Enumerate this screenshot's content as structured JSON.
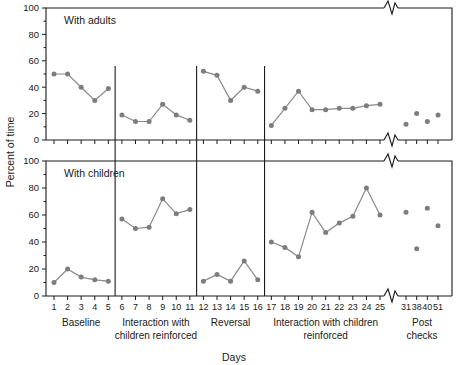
{
  "chart_data": {
    "type": "line",
    "title": "",
    "xlabel": "Days",
    "ylabel": "Percent of time",
    "ylim": [
      0,
      100
    ],
    "yticks": [
      0,
      20,
      40,
      60,
      80,
      100
    ],
    "grid": false,
    "legend": "none",
    "axis_break": true,
    "axis_break_note": "x-axis break between day 25 and day 31",
    "x": [
      1,
      2,
      3,
      4,
      5,
      6,
      7,
      8,
      9,
      10,
      11,
      12,
      13,
      14,
      15,
      16,
      17,
      18,
      19,
      20,
      21,
      22,
      23,
      24,
      25,
      31,
      38,
      40,
      51
    ],
    "xticklabels": [
      "1",
      "2",
      "3",
      "4",
      "5",
      "6",
      "7",
      "8",
      "9",
      "10",
      "11",
      "12",
      "13",
      "14",
      "15",
      "16",
      "17",
      "18",
      "19",
      "20",
      "21",
      "22",
      "23",
      "24",
      "25",
      "31",
      "38",
      "40",
      "51"
    ],
    "panels": [
      {
        "name": "with-adults",
        "title": "With adults",
        "series": [
          {
            "name": "Baseline",
            "days": [
              1,
              2,
              3,
              4,
              5
            ],
            "values": [
              50,
              50,
              40,
              30,
              39
            ],
            "connected": true
          },
          {
            "name": "Interaction with children reinforced",
            "days": [
              6,
              7,
              8,
              9,
              10,
              11
            ],
            "values": [
              19,
              14,
              14,
              27,
              19,
              15
            ],
            "connected": true
          },
          {
            "name": "Reversal",
            "days": [
              12,
              13,
              14,
              15,
              16
            ],
            "values": [
              52,
              49,
              30,
              40,
              37
            ],
            "connected": true
          },
          {
            "name": "Interaction with children reinforced (2)",
            "days": [
              17,
              18,
              19,
              20,
              21,
              22,
              23,
              24,
              25
            ],
            "values": [
              11,
              24,
              37,
              23,
              23,
              24,
              24,
              26,
              27
            ],
            "connected": true
          },
          {
            "name": "Post checks",
            "days": [
              31,
              38,
              40,
              51
            ],
            "values": [
              12,
              20,
              14,
              19
            ],
            "connected": false
          }
        ]
      },
      {
        "name": "with-children",
        "title": "With children",
        "series": [
          {
            "name": "Baseline",
            "days": [
              1,
              2,
              3,
              4,
              5
            ],
            "values": [
              10,
              20,
              14,
              12,
              11
            ],
            "connected": true
          },
          {
            "name": "Interaction with children reinforced",
            "days": [
              6,
              7,
              8,
              9,
              10,
              11
            ],
            "values": [
              57,
              50,
              51,
              72,
              61,
              64
            ],
            "connected": true
          },
          {
            "name": "Reversal",
            "days": [
              12,
              13,
              14,
              15,
              16
            ],
            "values": [
              11,
              16,
              11,
              26,
              12
            ],
            "connected": true
          },
          {
            "name": "Interaction with children reinforced (2)",
            "days": [
              17,
              18,
              19,
              20,
              21,
              22,
              23,
              24,
              25
            ],
            "values": [
              40,
              36,
              29,
              62,
              47,
              54,
              59,
              80,
              60
            ],
            "connected": true
          },
          {
            "name": "Post checks",
            "days": [
              31,
              38,
              40,
              51
            ],
            "values": [
              62,
              35,
              65,
              52
            ],
            "connected": false
          }
        ]
      }
    ],
    "phases": [
      {
        "label_line1": "Baseline",
        "label_line2": "",
        "start_day": 1,
        "end_day": 5
      },
      {
        "label_line1": "Interaction with",
        "label_line2": "children reinforced",
        "start_day": 6,
        "end_day": 11
      },
      {
        "label_line1": "Reversal",
        "label_line2": "",
        "start_day": 12,
        "end_day": 16
      },
      {
        "label_line1": "Interaction with children",
        "label_line2": "reinforced",
        "start_day": 17,
        "end_day": 25
      },
      {
        "label_line1": "Post",
        "label_line2": "checks",
        "start_day": 31,
        "end_day": 51
      }
    ],
    "colors": {
      "marker": "#7d7d7d",
      "line": "#8a8a8a",
      "axis": "#1a1a1a",
      "background": "#ffffff"
    }
  }
}
